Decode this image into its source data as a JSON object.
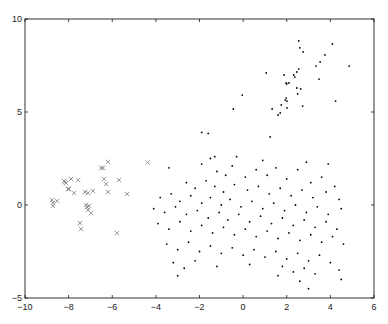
{
  "chart_data": {
    "type": "scatter",
    "title": "",
    "xlabel": "",
    "ylabel": "",
    "xlim": [
      -10,
      6
    ],
    "ylim": [
      -5,
      10
    ],
    "xticks": [
      -10,
      -8,
      -6,
      -4,
      -2,
      0,
      2,
      4,
      6
    ],
    "yticks": [
      -5,
      0,
      5,
      10
    ],
    "grid": false,
    "legend": null,
    "series": [
      {
        "name": "crosses",
        "marker": "x",
        "color": "#808080",
        "points": [
          [
            -6.19,
            2.31
          ],
          [
            -6.51,
            1.99
          ],
          [
            -6.42,
            1.99
          ],
          [
            -4.38,
            2.28
          ],
          [
            -8.21,
            1.29
          ],
          [
            -8.12,
            1.18
          ],
          [
            -8.17,
            1.24
          ],
          [
            -7.89,
            1.4
          ],
          [
            -7.57,
            1.34
          ],
          [
            -6.38,
            1.4
          ],
          [
            -6.28,
            1.13
          ],
          [
            -5.69,
            1.34
          ],
          [
            -8.03,
            0.86
          ],
          [
            -7.98,
            0.86
          ],
          [
            -7.75,
            0.65
          ],
          [
            -7.25,
            0.7
          ],
          [
            -7.11,
            0.65
          ],
          [
            -6.88,
            0.75
          ],
          [
            -6.19,
            0.7
          ],
          [
            -5.32,
            0.59
          ],
          [
            -8.76,
            0.27
          ],
          [
            -8.53,
            0.22
          ],
          [
            -8.72,
            0.11
          ],
          [
            -8.72,
            -0.05
          ],
          [
            -7.2,
            0.0
          ],
          [
            -7.16,
            -0.11
          ],
          [
            -7.11,
            -0.27
          ],
          [
            -7.06,
            -0.05
          ],
          [
            -6.97,
            -0.43
          ],
          [
            -7.48,
            -0.97
          ],
          [
            -7.43,
            -1.29
          ],
          [
            -5.78,
            -1.51
          ]
        ]
      },
      {
        "name": "dots",
        "marker": ".",
        "color": "#000000",
        "points": [
          [
            2.55,
            8.82
          ],
          [
            2.6,
            8.45
          ],
          [
            2.75,
            8.23
          ],
          [
            4.09,
            8.66
          ],
          [
            3.75,
            8.07
          ],
          [
            3.53,
            7.69
          ],
          [
            3.34,
            7.47
          ],
          [
            4.86,
            7.47
          ],
          [
            2.55,
            7.31
          ],
          [
            2.46,
            7.15
          ],
          [
            1.06,
            7.1
          ],
          [
            1.88,
            6.99
          ],
          [
            2.32,
            6.99
          ],
          [
            2.37,
            6.88
          ],
          [
            3.48,
            6.77
          ],
          [
            1.97,
            6.56
          ],
          [
            2.1,
            6.56
          ],
          [
            2.0,
            6.51
          ],
          [
            2.46,
            6.29
          ],
          [
            2.64,
            6.24
          ],
          [
            2.5,
            5.97
          ],
          [
            -0.04,
            5.91
          ],
          [
            1.97,
            5.75
          ],
          [
            1.93,
            5.64
          ],
          [
            2.01,
            5.59
          ],
          [
            4.24,
            5.59
          ],
          [
            1.75,
            5.38
          ],
          [
            2.73,
            5.32
          ],
          [
            2.01,
            5.22
          ],
          [
            -0.45,
            5.16
          ],
          [
            1.33,
            5.16
          ],
          [
            1.7,
            4.95
          ],
          [
            1.6,
            4.84
          ],
          [
            1.24,
            3.66
          ],
          [
            -1.9,
            3.9
          ],
          [
            -1.6,
            3.85
          ],
          [
            -3.4,
            2.0
          ],
          [
            -1.9,
            2.2
          ],
          [
            -1.5,
            2.5
          ],
          [
            -1.2,
            1.8
          ],
          [
            -0.8,
            1.6
          ],
          [
            -0.5,
            2.1
          ],
          [
            0.1,
            1.5
          ],
          [
            0.6,
            1.9
          ],
          [
            1.1,
            1.6
          ],
          [
            1.5,
            2.0
          ],
          [
            2.0,
            1.4
          ],
          [
            2.5,
            1.9
          ],
          [
            3.1,
            1.2
          ],
          [
            3.6,
            1.5
          ],
          [
            4.2,
            1.0
          ],
          [
            -2.6,
            1.2
          ],
          [
            -2.2,
            0.9
          ],
          [
            -1.7,
            1.3
          ],
          [
            -1.3,
            1.0
          ],
          [
            -0.9,
            0.7
          ],
          [
            -0.4,
            1.1
          ],
          [
            0.2,
            0.8
          ],
          [
            0.7,
            1.0
          ],
          [
            1.2,
            0.6
          ],
          [
            1.7,
            0.9
          ],
          [
            2.2,
            0.5
          ],
          [
            2.7,
            0.8
          ],
          [
            3.2,
            0.4
          ],
          [
            3.8,
            0.7
          ],
          [
            4.4,
            0.3
          ],
          [
            -3.8,
            0.4
          ],
          [
            -3.3,
            0.6
          ],
          [
            -2.9,
            0.2
          ],
          [
            -2.4,
            0.5
          ],
          [
            -1.9,
            0.1
          ],
          [
            -1.5,
            0.4
          ],
          [
            -1.0,
            0.0
          ],
          [
            -0.6,
            0.3
          ],
          [
            -0.1,
            -0.1
          ],
          [
            0.4,
            0.2
          ],
          [
            0.9,
            -0.2
          ],
          [
            1.4,
            0.1
          ],
          [
            1.9,
            -0.3
          ],
          [
            2.4,
            0.0
          ],
          [
            2.9,
            -0.4
          ],
          [
            3.4,
            -0.1
          ],
          [
            3.9,
            -0.5
          ],
          [
            4.5,
            -0.2
          ],
          [
            -4.1,
            -0.2
          ],
          [
            -3.6,
            -0.4
          ],
          [
            -3.1,
            -0.1
          ],
          [
            -2.6,
            -0.5
          ],
          [
            -2.1,
            -0.3
          ],
          [
            -1.6,
            -0.7
          ],
          [
            -1.1,
            -0.4
          ],
          [
            -0.7,
            -0.8
          ],
          [
            -0.2,
            -0.5
          ],
          [
            0.3,
            -0.9
          ],
          [
            0.8,
            -0.6
          ],
          [
            1.3,
            -1.0
          ],
          [
            1.8,
            -0.7
          ],
          [
            2.3,
            -1.1
          ],
          [
            2.8,
            -0.8
          ],
          [
            3.3,
            -1.2
          ],
          [
            3.8,
            -0.9
          ],
          [
            4.3,
            -1.3
          ],
          [
            -3.9,
            -1.0
          ],
          [
            -3.4,
            -1.3
          ],
          [
            -2.9,
            -0.9
          ],
          [
            -2.4,
            -1.4
          ],
          [
            -1.9,
            -1.1
          ],
          [
            -1.4,
            -1.5
          ],
          [
            -0.9,
            -1.2
          ],
          [
            -0.4,
            -1.6
          ],
          [
            0.1,
            -1.3
          ],
          [
            0.6,
            -1.7
          ],
          [
            1.1,
            -1.4
          ],
          [
            1.6,
            -1.8
          ],
          [
            2.1,
            -1.5
          ],
          [
            2.6,
            -1.9
          ],
          [
            3.1,
            -1.6
          ],
          [
            3.6,
            -2.0
          ],
          [
            4.1,
            -1.7
          ],
          [
            4.6,
            -2.1
          ],
          [
            -3.5,
            -2.1
          ],
          [
            -3.0,
            -2.4
          ],
          [
            -2.5,
            -2.0
          ],
          [
            -2.0,
            -2.5
          ],
          [
            -1.5,
            -2.2
          ],
          [
            -1.0,
            -2.6
          ],
          [
            -0.5,
            -2.3
          ],
          [
            0.0,
            -2.7
          ],
          [
            0.5,
            -2.4
          ],
          [
            1.0,
            -2.8
          ],
          [
            1.5,
            -2.5
          ],
          [
            2.0,
            -2.9
          ],
          [
            2.5,
            -2.6
          ],
          [
            3.0,
            -3.0
          ],
          [
            3.5,
            -2.7
          ],
          [
            4.0,
            -3.1
          ],
          [
            -3.2,
            -3.1
          ],
          [
            -2.7,
            -3.4
          ],
          [
            -2.2,
            -3.0
          ],
          [
            -1.2,
            -3.3
          ],
          [
            0.3,
            -3.2
          ],
          [
            1.8,
            -3.3
          ],
          [
            2.3,
            -3.6
          ],
          [
            2.8,
            -3.4
          ],
          [
            3.3,
            -3.7
          ],
          [
            4.4,
            -3.5
          ],
          [
            -3.0,
            -3.8
          ],
          [
            1.6,
            -3.8
          ],
          [
            2.6,
            -4.1
          ],
          [
            3.0,
            -4.5
          ],
          [
            4.5,
            -4.0
          ],
          [
            -1.3,
            2.6
          ],
          [
            -0.3,
            2.6
          ],
          [
            0.9,
            2.4
          ],
          [
            2.9,
            2.3
          ],
          [
            3.9,
            2.2
          ]
        ]
      }
    ]
  }
}
